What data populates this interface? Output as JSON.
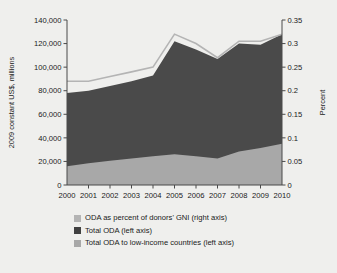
{
  "chart_data": {
    "type": "area",
    "title": "",
    "subtitle": "",
    "x": [
      2000,
      2001,
      2002,
      2003,
      2004,
      2005,
      2006,
      2007,
      2008,
      2009,
      2010
    ],
    "categories": [
      "2000",
      "2001",
      "2002",
      "2003",
      "2004",
      "2005",
      "2006",
      "2007",
      "2008",
      "2009",
      "2010"
    ],
    "xlabel": "",
    "ylabel": "2009 constant US$, millions",
    "y2label": "Percent",
    "ylim": [
      0,
      140000
    ],
    "y2lim": [
      0,
      0.35
    ],
    "yticks": [
      0,
      20000,
      40000,
      60000,
      80000,
      100000,
      120000,
      140000
    ],
    "ytick_labels": [
      "0",
      "20,000",
      "40,000",
      "60,000",
      "80,000",
      "100,000",
      "120,000",
      "140,000"
    ],
    "y2ticks": [
      0,
      0.05,
      0.1,
      0.15,
      0.2,
      0.25,
      0.3,
      0.35
    ],
    "y2tick_labels": [
      "0",
      "0.05",
      "0.1",
      "0.15",
      "0.2",
      "0.25",
      "0.3",
      "0.35"
    ],
    "grid": false,
    "legend_position": "below",
    "series": [
      {
        "name": "Total ODA to low-income countries (left axis)",
        "type": "area",
        "axis": "left",
        "color": "#a8a8a8",
        "values": [
          16000,
          18500,
          20500,
          22500,
          24500,
          26000,
          24500,
          22500,
          28500,
          31500,
          35000
        ]
      },
      {
        "name": "Total ODA (left axis)",
        "type": "area",
        "axis": "left",
        "color": "#4a4a4a",
        "values": [
          78000,
          80000,
          84000,
          88000,
          93000,
          122000,
          115000,
          107000,
          120000,
          119000,
          128000
        ]
      },
      {
        "name": "ODA as percent of donors' GNI (right axis)",
        "type": "line",
        "axis": "right",
        "color": "#b4b4b4",
        "values": [
          0.22,
          0.22,
          0.23,
          0.24,
          0.25,
          0.32,
          0.3,
          0.27,
          0.305,
          0.305,
          0.32
        ]
      }
    ]
  },
  "legend": {
    "items": [
      {
        "label": "ODA as percent of donors' GNI (right axis)",
        "color": "#b4b4b4"
      },
      {
        "label": "Total ODA (left axis)",
        "color": "#404040"
      },
      {
        "label": "Total ODA to low-income countries (left axis)",
        "color": "#a8a8a8"
      }
    ]
  }
}
